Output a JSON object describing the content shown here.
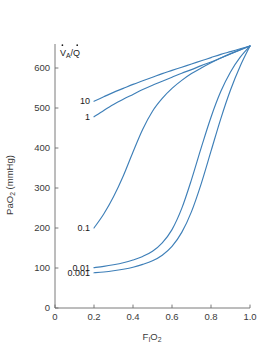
{
  "chart_data": {
    "type": "line",
    "title": "",
    "xlabel": "FIO2",
    "xlabel_main": "F",
    "xlabel_sub1": "I",
    "xlabel_mid": "O",
    "xlabel_sub2": "2",
    "ylabel": "PaO2 (mmHg)",
    "ylabel_main": "Pa",
    "ylabel_mid": "O",
    "ylabel_sub": "2",
    "ylabel_tail": " (mmHg)",
    "xlim": [
      0,
      1.0
    ],
    "ylim": [
      0,
      660
    ],
    "xticks": [
      0,
      0.2,
      0.4,
      0.6,
      0.8,
      1.0
    ],
    "xtick_labels": [
      "0",
      "0.2",
      "0.4",
      "0.6",
      "0.8",
      "1.0"
    ],
    "yticks": [
      0,
      100,
      200,
      300,
      400,
      500,
      600
    ],
    "ytick_labels": [
      "0",
      "100",
      "200",
      "300",
      "400",
      "500",
      "600"
    ],
    "grid": false,
    "legend_position": "inline-curve-labels",
    "legend_title": "VA/Q",
    "legend_title_v": "V",
    "legend_title_a": "A",
    "legend_title_slash": "/",
    "legend_title_q": "Q",
    "line_color": "#3E7FB8",
    "axis_color": "#6b6b6b",
    "text_color": "#3a3a3a",
    "background": "#ffffff",
    "series": [
      {
        "name": "10",
        "label": "10",
        "label_x": 0.205,
        "label_y": 517,
        "x": [
          0.2,
          0.25,
          0.3,
          0.35,
          0.4,
          0.45,
          0.5,
          0.55,
          0.6,
          0.65,
          0.7,
          0.75,
          0.8,
          0.85,
          0.9,
          0.95,
          1.0
        ],
        "values": [
          517,
          528,
          539,
          549,
          559,
          568,
          577,
          586,
          594,
          602,
          610,
          618,
          626,
          634,
          641,
          648,
          655
        ]
      },
      {
        "name": "1",
        "label": "1",
        "label_x": 0.205,
        "label_y": 478,
        "x": [
          0.2,
          0.25,
          0.3,
          0.35,
          0.4,
          0.45,
          0.5,
          0.55,
          0.6,
          0.65,
          0.7,
          0.75,
          0.8,
          0.85,
          0.9,
          0.95,
          1.0
        ],
        "values": [
          478,
          494,
          509,
          522,
          534,
          546,
          557,
          567,
          577,
          587,
          596,
          606,
          615,
          625,
          635,
          645,
          655
        ]
      },
      {
        "name": "0.1",
        "label": "0.1",
        "label_x": 0.205,
        "label_y": 200,
        "x": [
          0.2,
          0.25,
          0.3,
          0.35,
          0.4,
          0.45,
          0.5,
          0.55,
          0.6,
          0.65,
          0.7,
          0.75,
          0.8,
          0.85,
          0.9,
          0.95,
          1.0
        ],
        "values": [
          200,
          235,
          278,
          330,
          390,
          447,
          492,
          524,
          549,
          569,
          586,
          600,
          613,
          625,
          636,
          646,
          655
        ]
      },
      {
        "name": "0.01",
        "label": "0.01",
        "label_x": 0.205,
        "label_y": 101,
        "x": [
          0.2,
          0.25,
          0.3,
          0.35,
          0.4,
          0.45,
          0.5,
          0.55,
          0.6,
          0.65,
          0.7,
          0.75,
          0.8,
          0.85,
          0.9,
          0.95,
          1.0
        ],
        "values": [
          101,
          104,
          108,
          113,
          120,
          129,
          142,
          163,
          196,
          249,
          321,
          401,
          477,
          541,
          590,
          627,
          655
        ]
      },
      {
        "name": "0.001",
        "label": "0.001",
        "label_x": 0.205,
        "label_y": 88,
        "x": [
          0.2,
          0.25,
          0.3,
          0.35,
          0.4,
          0.45,
          0.5,
          0.55,
          0.6,
          0.65,
          0.7,
          0.75,
          0.8,
          0.85,
          0.9,
          0.95,
          1.0
        ],
        "values": [
          88,
          90,
          93,
          97,
          102,
          109,
          118,
          132,
          154,
          189,
          241,
          311,
          392,
          473,
          545,
          605,
          655
        ]
      }
    ]
  }
}
